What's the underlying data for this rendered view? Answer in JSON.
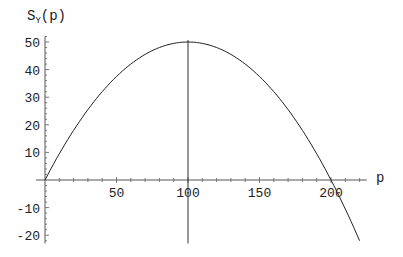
{
  "chart_data": {
    "type": "line",
    "title": "",
    "xlabel": "p",
    "ylabel": "S_Y(p)",
    "ylabel_main": "S",
    "ylabel_sub": "Y",
    "ylabel_arg": "(p)",
    "xlim": [
      0,
      225
    ],
    "ylim": [
      -22,
      52
    ],
    "x_ticks": [
      50,
      100,
      150,
      200
    ],
    "x_tick_labels": [
      "50",
      "100",
      "150",
      "200"
    ],
    "y_ticks": [
      50,
      40,
      30,
      20,
      10,
      -10,
      -20
    ],
    "y_tick_labels": [
      "50",
      "40",
      "30",
      "20",
      "10",
      "-10",
      "-20"
    ],
    "grid": false,
    "legend": null,
    "annotations": [
      {
        "type": "vertical-line",
        "x": 100,
        "y_range": [
          -23,
          50
        ]
      }
    ],
    "series": [
      {
        "name": "S_Y(p) = p(200 - p)/200",
        "x": [
          0,
          20,
          40,
          60,
          80,
          100,
          120,
          140,
          160,
          180,
          200,
          220
        ],
        "values": [
          0,
          18,
          32,
          42,
          48,
          50,
          48,
          42,
          32,
          18,
          0,
          -22
        ]
      }
    ]
  }
}
